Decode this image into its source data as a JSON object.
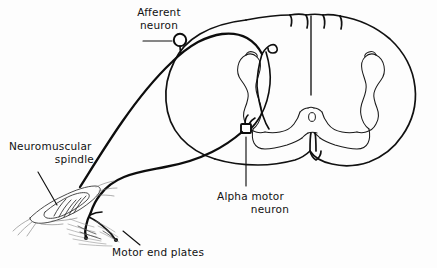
{
  "figure": {
    "background_color": "#fdfdfd",
    "ink_color": "#111111"
  },
  "labels": {
    "afferent_neuron": {
      "line1": "Afferent",
      "line2": "neuron"
    },
    "neuromuscular_spindle": {
      "line1": "Neuromuscular",
      "line2": "spindle"
    },
    "alpha_motor_neuron": {
      "line1": "Alpha motor",
      "line2": "neuron"
    },
    "motor_end_plates": {
      "line1": "Motor end plates"
    }
  },
  "structures": {
    "spinal_cord": "spinal-cord-cross-section",
    "gray_matter": "butterfly-gray-matter",
    "central_canal": "central-canal",
    "dorsal_root_ganglion": "dorsal-root-ganglion-soma",
    "alpha_motor_soma": "alpha-motor-neuron-soma",
    "muscle_spindle": "intrafusal-muscle-spindle",
    "end_plates": "motor-end-plates-on-muscle-fibers"
  }
}
